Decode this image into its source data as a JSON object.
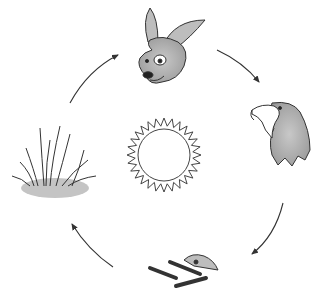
{
  "diagram": {
    "type": "cycle",
    "center": {
      "name": "sun",
      "label": "Sun"
    },
    "nodes": [
      {
        "id": "rabbit",
        "label": "Rabbit"
      },
      {
        "id": "eagle",
        "label": "Eagle"
      },
      {
        "id": "remains",
        "label": "Bones / decomposed remains"
      },
      {
        "id": "grass",
        "label": "Grass"
      }
    ],
    "arrows": [
      {
        "from": "grass",
        "to": "rabbit"
      },
      {
        "from": "rabbit",
        "to": "eagle"
      },
      {
        "from": "eagle",
        "to": "remains"
      },
      {
        "from": "remains",
        "to": "grass"
      }
    ],
    "colors": {
      "line": "#333333",
      "fill_gray": "#b8b8b8",
      "background": "#ffffff"
    }
  }
}
